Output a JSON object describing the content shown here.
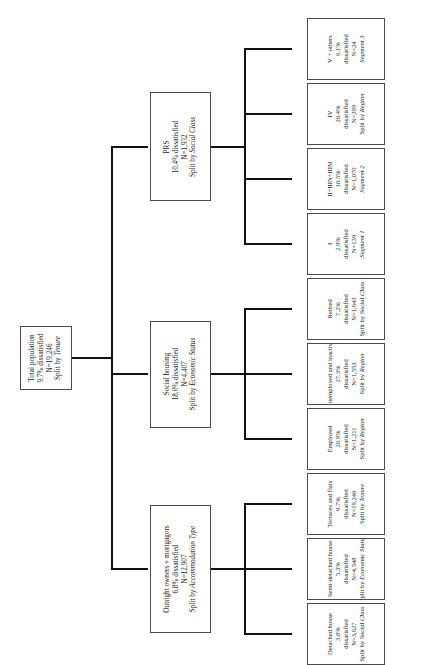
{
  "diagram": {
    "type": "decision-tree",
    "title": "",
    "orientation": "rotated-90",
    "line_color": "#111111",
    "box_border_color": "#4a4a4a",
    "background": "#ffffff"
  },
  "root": {
    "id": "total-population",
    "name": "Total population",
    "rate": "9.7% dissatisfied",
    "n": "N=19,246",
    "split": "Split by Tenure",
    "split_italic": "Tenure",
    "split_prefix": "Split by "
  },
  "level1": [
    {
      "id": "prs",
      "name": "PRS",
      "rate": "10.4% dissatisfied",
      "n": "N=1,932",
      "split_prefix": "Split by ",
      "split_italic": "Social Class"
    },
    {
      "id": "social-housing",
      "name": "Social housing",
      "rate": "18.0% dissatisfied",
      "n": "N=4,407",
      "split_prefix": "Split by ",
      "split_italic": "Economic Status"
    },
    {
      "id": "outright-owners-mortgagors",
      "name": "Outright owners + mortgagors",
      "rate": "6.8% dissatisfied",
      "n": "N=12,907",
      "split_prefix": "Split by ",
      "split_italic": "Accommodation Type"
    }
  ],
  "level2": [
    {
      "id": "v-plus-others",
      "parent": "prs",
      "name": "V + others",
      "rate": "6.1%",
      "rate2": "dissatisfied",
      "n": "N=24",
      "split_prefix": "",
      "split_italic": "Segment 3"
    },
    {
      "id": "iv",
      "parent": "prs",
      "name": "IV",
      "rate": "20.4%",
      "rate2": "dissatisfied",
      "n": "N=299",
      "split_prefix": "Split by ",
      "split_italic": "Region"
    },
    {
      "id": "ii-iiin-iiim",
      "parent": "prs",
      "name": "II+IIIN+IIIM",
      "rate": "10.3%",
      "rate2": "dissatisfied",
      "n": "N=1,070",
      "split_prefix": "",
      "split_italic": "Segment 2"
    },
    {
      "id": "class-i",
      "parent": "prs",
      "name": "I",
      "rate": "2.9%",
      "rate2": "dissatisfied",
      "n": "N=139",
      "split_prefix": "",
      "split_italic": "Segment 1"
    },
    {
      "id": "retired",
      "parent": "social-housing",
      "name": "Retired",
      "rate": "7.2%",
      "rate2": "dissatisfied",
      "n": "N=1,643",
      "split_prefix": "Split by ",
      "split_italic": "Social Class"
    },
    {
      "id": "unemployed-and-inactive",
      "parent": "social-housing",
      "name": "Unemployed and inactive",
      "rate": "27.3%",
      "rate2": "dissatisfied",
      "n": "N=1,553",
      "split_prefix": "Split by ",
      "split_italic": "Region"
    },
    {
      "id": "employed",
      "parent": "social-housing",
      "name": "Employed",
      "rate": "20.9%",
      "rate2": "dissatisfied",
      "n": "N=1,211",
      "split_prefix": "Split by ",
      "split_italic": "Region"
    },
    {
      "id": "terraces-and-flats",
      "parent": "outright-owners-mortgagors",
      "name": "Terraces and flats",
      "rate": "9.7%",
      "rate2": "dissatisfied",
      "n": "N=19,246",
      "split_prefix": "Split by ",
      "split_italic": "Tenure"
    },
    {
      "id": "semi-detached-house",
      "parent": "outright-owners-mortgagors",
      "name": "Semi-detached house",
      "rate": "5.3%",
      "rate2": "dissatisfied",
      "n": "N=4,548",
      "split_prefix": "Split by ",
      "split_italic": "Economic Status"
    },
    {
      "id": "detached-house",
      "parent": "outright-owners-mortgagors",
      "name": "Detached house",
      "rate": "3.8%",
      "rate2": "dissatisfied",
      "n": "N=3,627",
      "split_prefix": "Split by ",
      "split_italic": "Social Class"
    }
  ]
}
